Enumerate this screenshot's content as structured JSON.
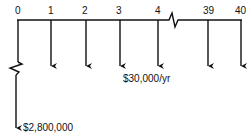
{
  "diagram": {
    "type": "cash-flow-diagram",
    "periods": [
      {
        "label": "0",
        "x": 18
      },
      {
        "label": "1",
        "x": 51
      },
      {
        "label": "2",
        "x": 86
      },
      {
        "label": "3",
        "x": 120
      },
      {
        "label": "4",
        "x": 158
      },
      {
        "label": "39",
        "x": 208
      },
      {
        "label": "40",
        "x": 241
      }
    ],
    "annual_flow_label": "$30,000/yr",
    "initial_flow_label": "$2,800,000",
    "axis_break_between": [
      "4",
      "39"
    ],
    "line_color": "#111111"
  }
}
